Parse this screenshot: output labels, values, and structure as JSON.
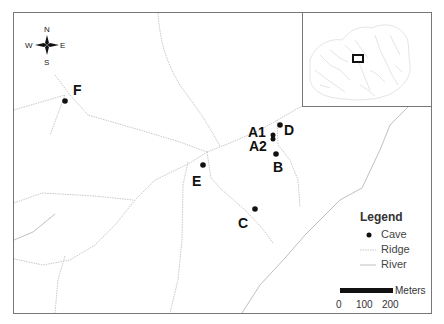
{
  "map": {
    "compass": {
      "north": "N",
      "south": "S",
      "east": "E",
      "west": "W"
    },
    "caves": [
      {
        "id": "F",
        "label": "F",
        "x": 65,
        "y": 101,
        "lx": 73,
        "ly": 95
      },
      {
        "id": "E",
        "label": "E",
        "x": 203,
        "y": 165,
        "lx": 192,
        "ly": 186
      },
      {
        "id": "C",
        "label": "C",
        "x": 255,
        "y": 209,
        "lx": 238,
        "ly": 228
      },
      {
        "id": "A1",
        "label": "A1",
        "x": 273,
        "y": 135,
        "lx": 248,
        "ly": 137
      },
      {
        "id": "A2",
        "label": "A2",
        "x": 273,
        "y": 139,
        "lx": 249,
        "ly": 151
      },
      {
        "id": "D",
        "label": "D",
        "x": 280,
        "y": 125,
        "lx": 284,
        "ly": 135
      },
      {
        "id": "B",
        "label": "B",
        "x": 276,
        "y": 154,
        "lx": 273,
        "ly": 172
      }
    ],
    "legend": {
      "title": "Legend",
      "items": [
        {
          "symbol": "cave-point",
          "label": "Cave"
        },
        {
          "symbol": "ridge-line",
          "label": "Ridge"
        },
        {
          "symbol": "river-line",
          "label": "River"
        }
      ]
    },
    "scale_bar": {
      "unit": "Meters",
      "ticks": [
        "0",
        "100",
        "200"
      ]
    },
    "colors": {
      "frame": "#777777",
      "ridge": "#c8c8c8",
      "river": "#c0c0c0",
      "cave": "#111111",
      "inset_box": "#111111"
    }
  }
}
